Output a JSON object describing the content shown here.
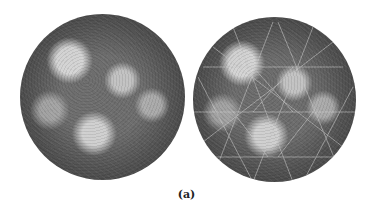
{
  "figure": {
    "panels": [
      {
        "id": "left",
        "description": "Surface rendering of an icosahedral virus capsid"
      },
      {
        "id": "right",
        "description": "Same capsid rendering with icosahedral lattice overlay"
      }
    ],
    "caption": "(a)",
    "colors": {
      "background": "#ffffff",
      "capsid_dark": "#3a3a3a",
      "capsid_light": "#e6e6e6",
      "lattice_line": "#bdbdbd"
    }
  }
}
